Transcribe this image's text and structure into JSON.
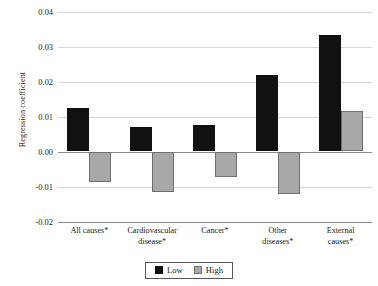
{
  "chart_data": {
    "type": "bar",
    "title": "",
    "xlabel": "",
    "ylabel": "Regression coefficient",
    "categories": [
      "All causes*",
      "Cardiovascular disease*",
      "Cancer*",
      "Other diseases*",
      "External causes*"
    ],
    "category_lines": [
      [
        "All causes*"
      ],
      [
        "Cardiovascular",
        "disease*"
      ],
      [
        "Cancer*"
      ],
      [
        "Other",
        "diseases*"
      ],
      [
        "External",
        "causes*"
      ]
    ],
    "series": [
      {
        "name": "Low",
        "color": "#111111",
        "values": [
          0.0123,
          0.0069,
          0.0077,
          0.0218,
          0.0334
        ]
      },
      {
        "name": "High",
        "color": "#a8a8a8",
        "values": [
          -0.0087,
          -0.0117,
          -0.0073,
          -0.012,
          0.0116
        ]
      }
    ],
    "ylim": [
      -0.02,
      0.04
    ],
    "yticks": [
      0.04,
      0.03,
      0.02,
      0.01,
      0.0,
      -0.01,
      -0.02
    ],
    "ytick_labels": [
      "0.04",
      "0.03",
      "0.02",
      "0.01",
      "0.00",
      "-0.01",
      "-0.02"
    ],
    "grid": true,
    "legend_position": "bottom-center",
    "legend_entries": [
      "Low",
      "High"
    ]
  }
}
